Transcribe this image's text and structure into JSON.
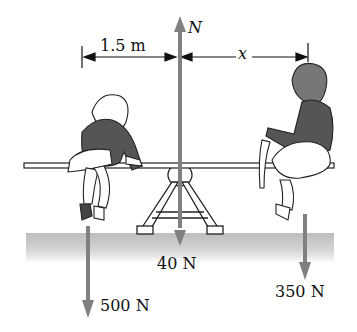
{
  "diagram": {
    "type": "free-body / torque diagram",
    "colors": {
      "arrow": "#808080",
      "ink": "#111111",
      "ground": "#c8c8c8",
      "clothing": "#555555"
    },
    "dimensions": {
      "left_distance": "1.5 m",
      "right_distance": "x"
    },
    "forces": {
      "normal": {
        "label": "N",
        "direction": "up"
      },
      "seesaw_weight": {
        "label": "40 N",
        "direction": "down"
      },
      "left_child_weight": {
        "label": "500 N",
        "direction": "down"
      },
      "right_child_weight": {
        "label": "350 N",
        "direction": "down"
      }
    }
  }
}
